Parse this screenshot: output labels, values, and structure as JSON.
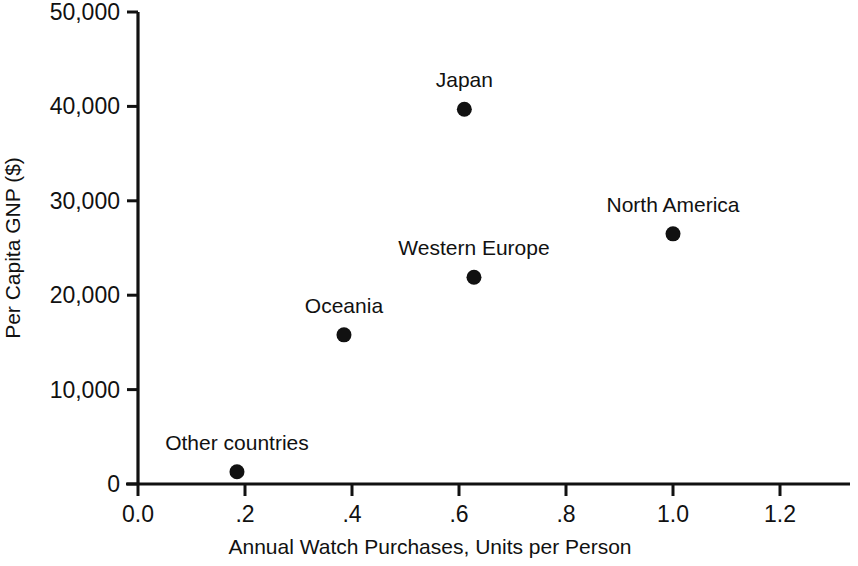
{
  "chart_data": {
    "type": "scatter",
    "title": "",
    "xlabel": "Annual Watch Purchases, Units per Person",
    "ylabel": "Per Capita GNP ($)",
    "xlim": [
      0.0,
      1.33
    ],
    "ylim": [
      0,
      50000
    ],
    "grid": false,
    "legend": "none",
    "xticks": [
      0.0,
      0.2,
      0.4,
      0.6,
      0.8,
      1.0,
      1.2
    ],
    "xtick_labels": [
      "0.0",
      ".2",
      ".4",
      ".6",
      ".8",
      "1.0",
      "1.2"
    ],
    "yticks": [
      0,
      10000,
      20000,
      30000,
      40000,
      50000
    ],
    "ytick_labels": [
      "0",
      "10,000",
      "20,000",
      "30,000",
      "40,000",
      "50,000"
    ],
    "marker_color": "#111111",
    "points": [
      {
        "label": "Other countries",
        "x": 0.185,
        "y": 1300,
        "label_dx": 0,
        "label_dy": -22,
        "label_anchor": "middle"
      },
      {
        "label": "Oceania",
        "x": 0.385,
        "y": 15800,
        "label_dx": 0,
        "label_dy": -22,
        "label_anchor": "middle"
      },
      {
        "label": "Western Europe",
        "x": 0.628,
        "y": 21900,
        "label_dx": 0,
        "label_dy": -22,
        "label_anchor": "middle"
      },
      {
        "label": "Japan",
        "x": 0.61,
        "y": 39700,
        "label_dx": 0,
        "label_dy": -22,
        "label_anchor": "middle"
      },
      {
        "label": "North America",
        "x": 1.0,
        "y": 26500,
        "label_dx": 0,
        "label_dy": -22,
        "label_anchor": "middle"
      }
    ]
  }
}
